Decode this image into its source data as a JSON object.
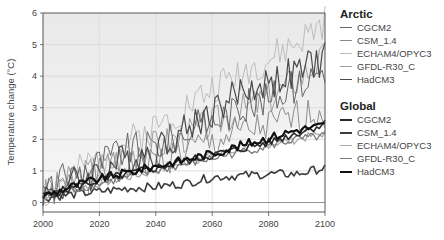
{
  "chart_data": {
    "type": "line",
    "title": "",
    "xlabel": "",
    "ylabel": "Temperature change (°C)",
    "xlim": [
      2000,
      2100
    ],
    "ylim": [
      0,
      6
    ],
    "xticks": [
      2000,
      2020,
      2040,
      2060,
      2080,
      2100
    ],
    "yticks": [
      0,
      1,
      2,
      3,
      4,
      5,
      6
    ],
    "grid": true,
    "legend_position": "right",
    "legend_groups": [
      {
        "title": "Arctic",
        "entries": [
          "CGCM2",
          "CSM_1.4",
          "ECHAM4/OPYC3",
          "GFDL-R30_C",
          "HadCM3"
        ]
      },
      {
        "title": "Global",
        "entries": [
          "CGCM2",
          "CSM_1.4",
          "ECHAM4/OPYC3",
          "GFDL-R30_C",
          "HadCM3"
        ]
      }
    ],
    "x": [
      2000,
      2010,
      2020,
      2030,
      2040,
      2050,
      2060,
      2070,
      2080,
      2090,
      2100
    ],
    "series": [
      {
        "name": "Arctic CGCM2",
        "group": "Arctic",
        "color": "#666666",
        "width": 1,
        "values": [
          0.3,
          0.9,
          1.3,
          1.7,
          1.8,
          2.2,
          2.6,
          3.0,
          3.3,
          3.7,
          4.3
        ]
      },
      {
        "name": "Arctic CSM_1.4",
        "group": "Arctic",
        "color": "#8c8c8c",
        "width": 1,
        "values": [
          0.2,
          0.6,
          0.9,
          1.2,
          1.3,
          1.6,
          1.9,
          2.2,
          2.4,
          2.7,
          2.9
        ]
      },
      {
        "name": "Arctic ECHAM4/OPYC3",
        "group": "Arctic",
        "color": "#bdbdbd",
        "width": 1,
        "values": [
          0.2,
          0.8,
          1.4,
          1.9,
          2.4,
          3.0,
          3.6,
          4.1,
          4.5,
          5.0,
          5.7
        ]
      },
      {
        "name": "Arctic GFDL-R30_C",
        "group": "Arctic",
        "color": "#9e9e9e",
        "width": 1,
        "values": [
          0.2,
          0.7,
          1.1,
          1.5,
          1.8,
          2.1,
          2.5,
          2.9,
          3.3,
          3.9,
          4.6
        ]
      },
      {
        "name": "Arctic HadCM3",
        "group": "Arctic",
        "color": "#4a4a4a",
        "width": 1.2,
        "values": [
          0.2,
          0.6,
          1.0,
          1.4,
          1.7,
          2.3,
          2.9,
          3.5,
          3.8,
          4.1,
          4.6
        ]
      },
      {
        "name": "Global CGCM2",
        "group": "Global",
        "color": "#2a2a2a",
        "width": 1.6,
        "values": [
          0.2,
          0.45,
          0.7,
          0.9,
          1.1,
          1.3,
          1.5,
          1.7,
          1.9,
          2.2,
          2.5
        ]
      },
      {
        "name": "Global CSM_1.4",
        "group": "Global",
        "color": "#3c3c3c",
        "width": 1.6,
        "values": [
          0.15,
          0.25,
          0.35,
          0.45,
          0.5,
          0.6,
          0.8,
          0.85,
          0.9,
          0.9,
          1.1
        ]
      },
      {
        "name": "Global ECHAM4/OPYC3",
        "group": "Global",
        "color": "#aaaaaa",
        "width": 1.3,
        "values": [
          0.2,
          0.4,
          0.6,
          0.8,
          1.0,
          1.25,
          1.5,
          1.7,
          1.85,
          2.0,
          2.2
        ]
      },
      {
        "name": "Global GFDL-R30_C",
        "group": "Global",
        "color": "#7a7a7a",
        "width": 1.3,
        "values": [
          0.2,
          0.4,
          0.6,
          0.8,
          1.0,
          1.2,
          1.4,
          1.6,
          1.8,
          2.0,
          2.1
        ]
      },
      {
        "name": "Global HadCM3",
        "group": "Global",
        "color": "#111111",
        "width": 2.2,
        "values": [
          0.2,
          0.5,
          0.75,
          0.95,
          1.15,
          1.35,
          1.55,
          1.8,
          2.05,
          2.3,
          2.45
        ]
      }
    ]
  },
  "legend": {
    "arctic": {
      "title": "Arctic",
      "items": [
        {
          "label": "CGCM2",
          "color": "#666666",
          "width": 1
        },
        {
          "label": "CSM_1.4",
          "color": "#8c8c8c",
          "width": 1
        },
        {
          "label": "ECHAM4/OPYC3",
          "color": "#bdbdbd",
          "width": 1
        },
        {
          "label": "GFDL-R30_C",
          "color": "#9e9e9e",
          "width": 1
        },
        {
          "label": "HadCM3",
          "color": "#4a4a4a",
          "width": 1.3
        }
      ]
    },
    "global": {
      "title": "Global",
      "items": [
        {
          "label": "CGCM2",
          "color": "#2a2a2a",
          "width": 2
        },
        {
          "label": "CSM_1.4",
          "color": "#3c3c3c",
          "width": 2
        },
        {
          "label": "ECHAM4/OPYC3",
          "color": "#aaaaaa",
          "width": 1.3
        },
        {
          "label": "GFDL-R30_C",
          "color": "#7a7a7a",
          "width": 1.3
        },
        {
          "label": "HadCM3",
          "color": "#111111",
          "width": 2.5
        }
      ]
    }
  },
  "axes": {
    "ylabel": "Temperature change (°C)",
    "yticks": [
      "0",
      "1",
      "2",
      "3",
      "4",
      "5",
      "6"
    ],
    "xticks": [
      "2000",
      "2020",
      "2040",
      "2060",
      "2080",
      "2100"
    ]
  }
}
